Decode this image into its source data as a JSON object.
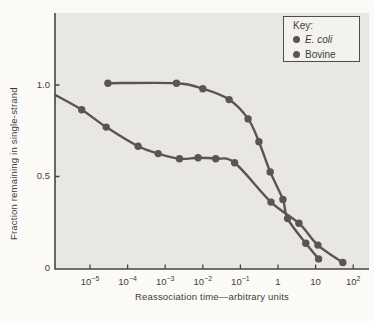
{
  "figure": {
    "legend_title": "Key:"
  },
  "chart_data": {
    "type": "line",
    "title": "",
    "xlabel": "Reassociation time—arbitrary units",
    "ylabel": "Fraction remaining in single-strand",
    "x_scale": "log",
    "x_range_log": [
      -5.95,
      2.42
    ],
    "ylim": [
      0,
      1.4
    ],
    "grid": false,
    "legend_position": "top-right",
    "plot_bg": "#e8e7e3",
    "axis_color": "#454545",
    "series_color": "#5b5551",
    "x_ticks": [
      {
        "log": -5,
        "base": "10",
        "exp": "−5"
      },
      {
        "log": -4,
        "base": "10",
        "exp": "−4"
      },
      {
        "log": -3,
        "base": "10",
        "exp": "−3"
      },
      {
        "log": -2,
        "base": "10",
        "exp": "−2"
      },
      {
        "log": -1,
        "base": "10",
        "exp": "−1"
      },
      {
        "log": 0,
        "base": "1",
        "exp": ""
      },
      {
        "log": 1,
        "base": "10",
        "exp": ""
      },
      {
        "log": 2,
        "base": "10",
        "exp": "2"
      }
    ],
    "y_ticks": [
      {
        "value": 1.0,
        "label": "1.0"
      },
      {
        "value": 0.5,
        "label": "0.5"
      },
      {
        "value": 0,
        "label": "0"
      }
    ],
    "series": [
      {
        "name": "E. coli",
        "italic": true,
        "points": [
          [
            3e-05,
            1.01
          ],
          [
            0.002,
            1.01
          ],
          [
            0.01,
            0.98
          ],
          [
            0.05,
            0.92
          ],
          [
            0.16,
            0.815
          ],
          [
            0.31,
            0.69
          ],
          [
            0.62,
            0.525
          ],
          [
            1.35,
            0.375
          ],
          [
            1.8,
            0.27
          ],
          [
            5.5,
            0.135
          ],
          [
            12,
            0.05
          ]
        ]
      },
      {
        "name": "Bovine",
        "italic": false,
        "line_start": [
          1.2e-06,
          0.945
        ],
        "points": [
          [
            6e-06,
            0.865
          ],
          [
            2.7e-05,
            0.77
          ],
          [
            0.00019,
            0.665
          ],
          [
            0.00065,
            0.625
          ],
          [
            0.0024,
            0.597
          ],
          [
            0.0075,
            0.602
          ],
          [
            0.022,
            0.597
          ],
          [
            0.07,
            0.575
          ],
          [
            0.65,
            0.36
          ],
          [
            3.6,
            0.245
          ],
          [
            11.5,
            0.125
          ],
          [
            53,
            0.03
          ]
        ]
      }
    ]
  }
}
